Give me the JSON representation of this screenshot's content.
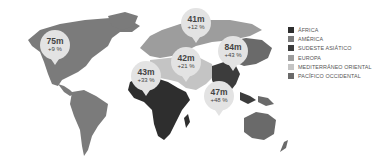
{
  "legend": {
    "items": [
      {
        "label": "ÁFRICA",
        "color": "#2e2e2e"
      },
      {
        "label": "AMÉRICA",
        "color": "#7b7b7b"
      },
      {
        "label": "SUDESTE ASIÁTICO",
        "color": "#3c3c3c"
      },
      {
        "label": "EUROPA",
        "color": "#9d9d9d"
      },
      {
        "label": "MEDITERRÁNEO ORIENTAL",
        "color": "#c4c4c4"
      },
      {
        "label": "PACÍFICO OCCIDENTAL",
        "color": "#6a6a6a"
      }
    ]
  },
  "callouts": [
    {
      "region": "América",
      "value": "75m",
      "change": "+9 %"
    },
    {
      "region": "Europa",
      "value": "41m",
      "change": "+12 %"
    },
    {
      "region": "Mediterráneo Oriental",
      "value": "42m",
      "change": "+21 %"
    },
    {
      "region": "África",
      "value": "43m",
      "change": "+33 %"
    },
    {
      "region": "Pacífico Occidental",
      "value": "84m",
      "change": "+43 %"
    },
    {
      "region": "Sudeste Asiático",
      "value": "47m",
      "change": "+48 %"
    }
  ],
  "colors": {
    "africa": "#2e2e2e",
    "america": "#7b7b7b",
    "southeast_asia": "#3c3c3c",
    "europe": "#9d9d9d",
    "eastern_mediterranean": "#c4c4c4",
    "western_pacific": "#6a6a6a",
    "callout_bg": "#e3e3e3"
  }
}
